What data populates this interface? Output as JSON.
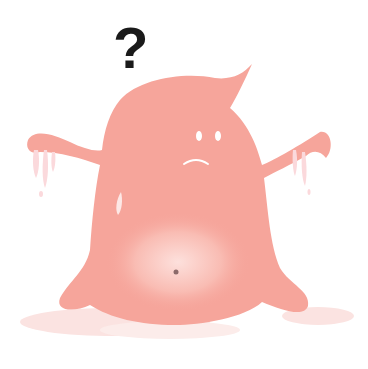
{
  "illustration": {
    "subject": "confused pink blob creature",
    "question_mark": "?",
    "colors": {
      "body": "#f6a59b",
      "body_highlight": "#fcd3cf",
      "puddle": "#fbe0de",
      "drip": "#fbd9dc",
      "eyes": "#ffffff",
      "mouth": "#ffffff",
      "navel": "#8c6a6a",
      "question_mark": "#1a1a1a"
    },
    "expression": "sad / puzzled"
  }
}
